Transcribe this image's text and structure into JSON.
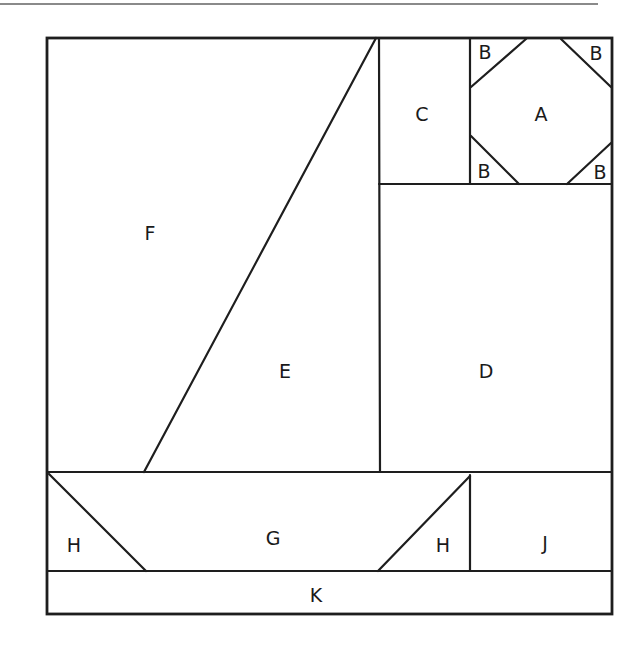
{
  "diagram": {
    "type": "quilt-block-pattern",
    "pieces": [
      {
        "id": "A",
        "label": "A",
        "shape": "octagon"
      },
      {
        "id": "B1",
        "label": "B",
        "shape": "corner-triangle"
      },
      {
        "id": "B2",
        "label": "B",
        "shape": "corner-triangle"
      },
      {
        "id": "B3",
        "label": "B",
        "shape": "corner-triangle"
      },
      {
        "id": "B4",
        "label": "B",
        "shape": "corner-triangle"
      },
      {
        "id": "C",
        "label": "C",
        "shape": "rectangle"
      },
      {
        "id": "D",
        "label": "D",
        "shape": "rectangle"
      },
      {
        "id": "E",
        "label": "E",
        "shape": "triangle"
      },
      {
        "id": "F",
        "label": "F",
        "shape": "trapezoid"
      },
      {
        "id": "G",
        "label": "G",
        "shape": "trapezoid"
      },
      {
        "id": "H1",
        "label": "H",
        "shape": "triangle"
      },
      {
        "id": "H2",
        "label": "H",
        "shape": "triangle"
      },
      {
        "id": "J",
        "label": "J",
        "shape": "rectangle"
      },
      {
        "id": "K",
        "label": "K",
        "shape": "rectangle"
      }
    ],
    "colors": {
      "line": "#1e1e1e",
      "background": "#ffffff",
      "top_rule": "#8a8a8a"
    }
  }
}
